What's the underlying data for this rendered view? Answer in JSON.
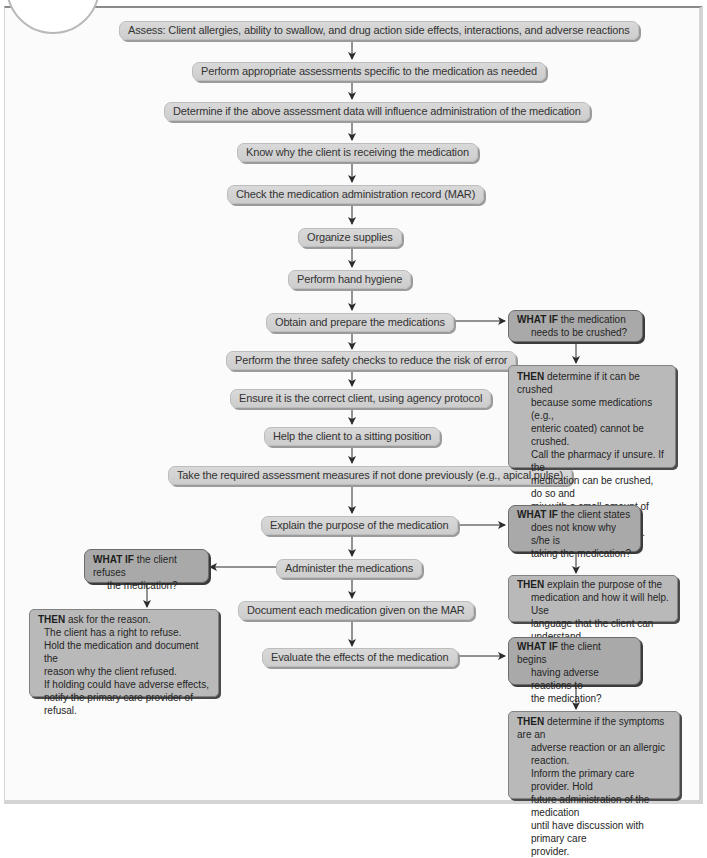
{
  "diagram": {
    "type": "flowchart",
    "main_steps": [
      {
        "id": "assess",
        "label": "Assess: Client allergies, ability to swallow, and drug action side effects, interactions, and adverse reactions"
      },
      {
        "id": "perform-assessments",
        "label": "Perform appropriate assessments specific to the medication as needed"
      },
      {
        "id": "determine",
        "label": "Determine if the above assessment data will influence administration of the medication"
      },
      {
        "id": "know-why",
        "label": "Know why the client is receiving the medication"
      },
      {
        "id": "check-mar",
        "label": "Check the medication administration record (MAR)"
      },
      {
        "id": "organize",
        "label": "Organize supplies"
      },
      {
        "id": "hand-hygiene",
        "label": "Perform hand hygiene"
      },
      {
        "id": "obtain",
        "label": "Obtain and prepare the medications"
      },
      {
        "id": "safety-checks",
        "label": "Perform the three safety checks to reduce the risk of error"
      },
      {
        "id": "ensure-client",
        "label": "Ensure it is the correct client, using agency protocol"
      },
      {
        "id": "sitting",
        "label": "Help the client to a sitting position"
      },
      {
        "id": "required-assessment",
        "label": "Take the required assessment measures if not done previously (e.g., apical pulse)"
      },
      {
        "id": "explain",
        "label": "Explain the purpose of the medication"
      },
      {
        "id": "administer",
        "label": "Administer the medications"
      },
      {
        "id": "document",
        "label": "Document each medication given on the MAR"
      },
      {
        "id": "evaluate",
        "label": "Evaluate the effects of the medication"
      }
    ],
    "branches": {
      "crushed": {
        "from": "obtain",
        "what_if_keyword": "WHAT IF",
        "what_if_lines": [
          "the medication",
          "needs to be crushed?"
        ],
        "then_keyword": "THEN",
        "then_lines": [
          "determine if it can be crushed",
          "because some medications (e.g.,",
          "enteric coated) cannot be crushed.",
          "Call the pharmacy if unsure. If the",
          "medication can be crushed, do so and",
          "mix with a small amount of soft food.",
          "Label the medication cup."
        ]
      },
      "why": {
        "from": "explain",
        "what_if_keyword": "WHAT IF",
        "what_if_lines": [
          "the client states",
          "does not know why s/he is",
          "taking the medication?"
        ],
        "then_keyword": "THEN",
        "then_lines": [
          "explain the purpose of the",
          "medication and how it will help. Use",
          "language that the client can understand."
        ]
      },
      "refuses": {
        "from": "administer",
        "what_if_keyword": "WHAT IF",
        "what_if_lines": [
          "the client refuses",
          "the medication?"
        ],
        "then_keyword": "THEN",
        "then_lines": [
          "ask for the reason.",
          "The client has a right to refuse.",
          "Hold the medication and document the",
          "reason why the client refused.",
          "If holding could have adverse effects,",
          "notify the primary care provider of refusal."
        ]
      },
      "adverse": {
        "from": "evaluate",
        "what_if_keyword": "WHAT IF",
        "what_if_lines": [
          "the client begins",
          "having adverse reactions to",
          "the medication?"
        ],
        "then_keyword": "THEN",
        "then_lines": [
          "determine if the symptoms are an",
          "adverse reaction or an allergic reaction.",
          "Inform the primary care provider. Hold",
          "future administration of the medication",
          "until have discussion with primary care",
          "provider."
        ]
      }
    },
    "colors": {
      "step_fill": "#d4d4d4",
      "what_if_fill": "#a9a9a9",
      "then_fill": "#b9b9b9",
      "connector": "#2b2b2b"
    }
  }
}
